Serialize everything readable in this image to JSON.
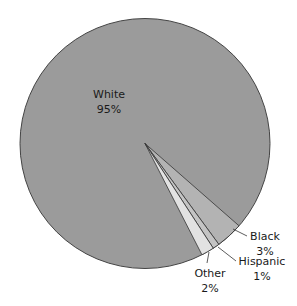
{
  "chart_data": {
    "type": "pie",
    "title": "",
    "categories": [
      "White",
      "Black",
      "Hispanic",
      "Other"
    ],
    "values": [
      95,
      3,
      1,
      2
    ],
    "unit": "%",
    "labels": [
      {
        "name": "White",
        "value_text": "95%"
      },
      {
        "name": "Black",
        "value_text": "3%"
      },
      {
        "name": "Hispanic",
        "value_text": "1%"
      },
      {
        "name": "Other",
        "value_text": "2%"
      }
    ],
    "colors": {
      "White": "#9b9b9b",
      "Black": "#b3b3b3",
      "Hispanic": "#c4c4c4",
      "Other": "#e2e2e2"
    },
    "slice_angles_deg": {
      "Black": [
        41.2,
        53.8
      ],
      "Hispanic": [
        53.8,
        56.9
      ],
      "Other": [
        56.9,
        62.9
      ]
    },
    "legend": "none (direct labels)"
  }
}
